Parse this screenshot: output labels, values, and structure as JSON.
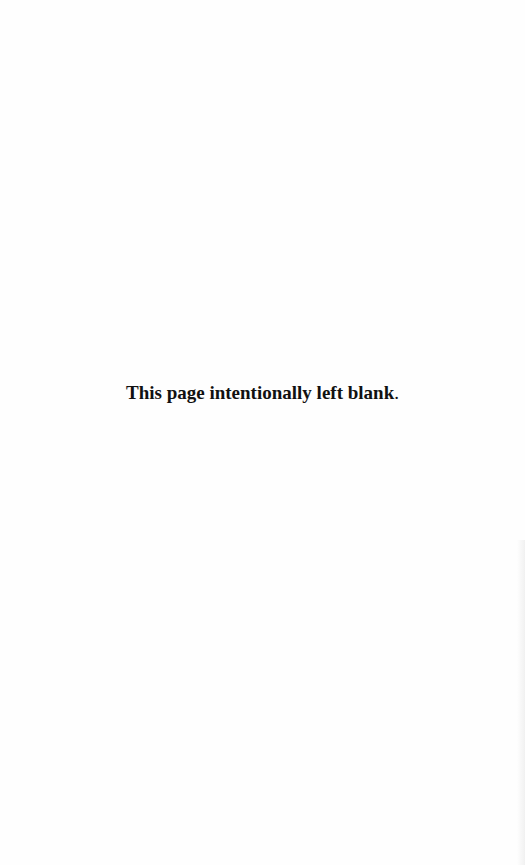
{
  "page": {
    "notice_text": "This page intentionally left blank",
    "notice_punctuation": "."
  }
}
